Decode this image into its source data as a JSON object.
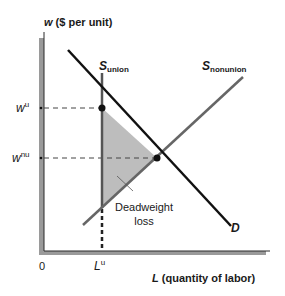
{
  "diagram": {
    "type": "economics-supply-demand",
    "y_axis": {
      "var": "w",
      "label_rest": " ($ per unit)"
    },
    "x_axis": {
      "var": "L",
      "label_rest": " (quantity of labor)"
    },
    "origin_label": "0",
    "curves": {
      "supply_union": {
        "base": "S",
        "sub": "union"
      },
      "supply_nonunion": {
        "base": "S",
        "sub": "nonunion"
      },
      "demand": {
        "label": "D"
      }
    },
    "y_ticks": [
      {
        "base": "w",
        "sup": "u"
      },
      {
        "base": "w",
        "sup": "nu"
      }
    ],
    "x_ticks": [
      {
        "base": "L",
        "sup": "u"
      }
    ],
    "annotation": {
      "line1": "Deadweight",
      "line2": "loss"
    },
    "colors": {
      "axis": "#2a2a2a",
      "axis_shadow": "#9a9a9a",
      "demand": "#111111",
      "supply_union": "#555555",
      "supply_nonunion": "#666666",
      "shade": "#bdbdbd",
      "dashed": "#444444"
    }
  }
}
